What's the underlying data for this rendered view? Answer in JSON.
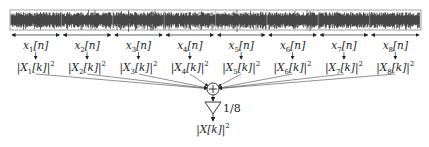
{
  "diagram": {
    "signal_box": {
      "x": 10,
      "y": 10,
      "w": 411,
      "h": 20,
      "segments": 8
    },
    "segments": [
      {
        "index": 1,
        "time_label": "x",
        "time_sub": "1",
        "time_arg": "[n]",
        "spec_label": "|X",
        "spec_sub": "1",
        "spec_arg": "[k]|",
        "spec_pow": "2"
      },
      {
        "index": 2,
        "time_label": "x",
        "time_sub": "2",
        "time_arg": "[n]",
        "spec_label": "|X",
        "spec_sub": "2",
        "spec_arg": "[k]|",
        "spec_pow": "2"
      },
      {
        "index": 3,
        "time_label": "x",
        "time_sub": "3",
        "time_arg": "[n]",
        "spec_label": "|X",
        "spec_sub": "3",
        "spec_arg": "[k]|",
        "spec_pow": "2"
      },
      {
        "index": 4,
        "time_label": "x",
        "time_sub": "4",
        "time_arg": "[n]",
        "spec_label": "|X",
        "spec_sub": "4",
        "spec_arg": "[k]|",
        "spec_pow": "2"
      },
      {
        "index": 5,
        "time_label": "x",
        "time_sub": "5",
        "time_arg": "[n]",
        "spec_label": "|X",
        "spec_sub": "5",
        "spec_arg": "[k]|",
        "spec_pow": "2"
      },
      {
        "index": 6,
        "time_label": "x",
        "time_sub": "6",
        "time_arg": "[n]",
        "spec_label": "|X",
        "spec_sub": "6",
        "spec_arg": "[k]|",
        "spec_pow": "2"
      },
      {
        "index": 7,
        "time_label": "x",
        "time_sub": "7",
        "time_arg": "[n]",
        "spec_label": "|X",
        "spec_sub": "7",
        "spec_arg": "[k]|",
        "spec_pow": "2"
      },
      {
        "index": 8,
        "time_label": "x",
        "time_sub": "8",
        "time_arg": "[n]",
        "spec_label": "|X",
        "spec_sub": "8",
        "spec_arg": "[k]|",
        "spec_pow": "2"
      }
    ],
    "summer": {
      "symbol": "+",
      "cx": 213,
      "cy": 89,
      "r": 6
    },
    "gain": {
      "label": "1/8"
    },
    "output": {
      "label": "|X[k]|",
      "pow": "2"
    },
    "colors": {
      "ink": "#222222",
      "waveform": "#1a1a1a",
      "box": "#888888"
    }
  }
}
